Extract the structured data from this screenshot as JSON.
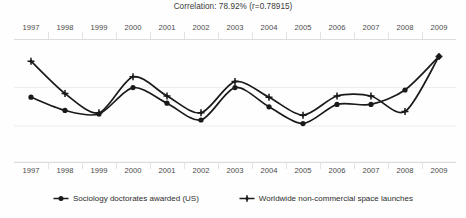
{
  "chart_data": {
    "type": "line",
    "title": "Correlation: 78.92% (r=0.78915)",
    "xlabel": "",
    "ylabel": "",
    "grid": true,
    "legend_position": "bottom",
    "x": [
      1997,
      1998,
      1999,
      2000,
      2001,
      2002,
      2003,
      2004,
      2005,
      2006,
      2007,
      2008,
      2009
    ],
    "categories": [
      "1997",
      "1998",
      "1999",
      "2000",
      "2001",
      "2002",
      "2003",
      "2004",
      "2005",
      "2006",
      "2007",
      "2008",
      "2009"
    ],
    "ylim": [
      0,
      100
    ],
    "series": [
      {
        "name": "Sociology doctorates awarded (US)",
        "marker": "diamond-dot",
        "color": "#1a1a1a",
        "values": [
          54,
          43,
          40,
          62,
          49,
          35,
          62,
          46,
          32,
          48,
          48,
          60,
          88
        ]
      },
      {
        "name": "Worldwide non-commercial space launches",
        "marker": "cross-dot",
        "color": "#1a1a1a",
        "values": [
          84,
          57,
          41,
          71,
          55,
          41,
          67,
          54,
          39,
          55,
          55,
          42,
          88
        ]
      }
    ],
    "annotations": []
  },
  "axis": {
    "top_labels": [
      "1997",
      "1998",
      "1999",
      "2000",
      "2001",
      "2002",
      "2003",
      "2004",
      "2005",
      "2006",
      "2007",
      "2008",
      "2009"
    ],
    "bottom_labels": [
      "1997",
      "1998",
      "1999",
      "2000",
      "2001",
      "2002",
      "2003",
      "2004",
      "2005",
      "2006",
      "2007",
      "2008",
      "2009"
    ]
  },
  "legend": {
    "items": [
      {
        "label": "Sociology doctorates awarded (US)",
        "marker": "diamond-dot"
      },
      {
        "label": "Worldwide non-commercial space launches",
        "marker": "cross-dot"
      }
    ]
  },
  "colors": {
    "background": "#fefefe",
    "gridline": "#ededed",
    "axis_rule": "#dcdcdc",
    "series_line": "#1a1a1a",
    "title_text": "#3a3a3a",
    "label_text": "#4a4a4a"
  }
}
